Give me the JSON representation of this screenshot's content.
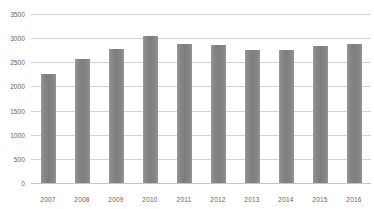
{
  "chart_data": {
    "type": "bar",
    "title": "",
    "xlabel": "",
    "ylabel": "",
    "categories": [
      "2007",
      "2008",
      "2009",
      "2010",
      "2011",
      "2012",
      "2013",
      "2014",
      "2015",
      "2016"
    ],
    "values": [
      2250,
      2560,
      2780,
      3040,
      2870,
      2860,
      2760,
      2750,
      2830,
      2870
    ],
    "ylim": [
      0,
      3500
    ],
    "yticks": [
      0,
      500,
      1000,
      1500,
      2000,
      2500,
      3000,
      3500
    ],
    "ytick_labels": [
      "0",
      "500",
      "1000",
      "1500",
      "2000",
      "2500",
      "3000",
      "3500"
    ],
    "grid": true,
    "legend": false,
    "series": [
      {
        "name": "",
        "values": [
          2250,
          2560,
          2780,
          3040,
          2870,
          2860,
          2760,
          2750,
          2830,
          2870
        ],
        "color": "#808080"
      }
    ]
  },
  "colors": {
    "bar": "#808080",
    "gridline": "#d2d2d2",
    "axis": "#c4c4c4",
    "tick_text": "#636363",
    "background": "#ffffff"
  }
}
